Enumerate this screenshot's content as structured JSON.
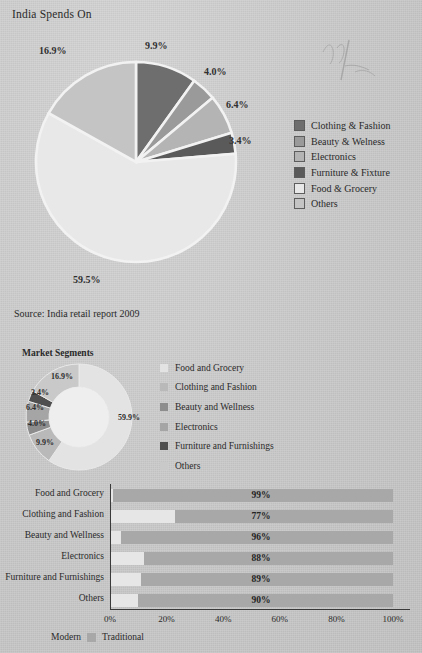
{
  "page": {
    "background_color": "#cdcdcd",
    "title": "India Spends On",
    "source": "Source: India retail report 2009",
    "scribble_icon": "handwriting-scribble"
  },
  "pie_chart": {
    "title": "India Spends On",
    "legend_title": "",
    "legend": [
      {
        "label": "Clothing & Fashion",
        "color": "#6e6e6e"
      },
      {
        "label": "Beauty & Welness",
        "color": "#9a9a9a"
      },
      {
        "label": "Electronics",
        "color": "#b4b4b4"
      },
      {
        "label": "Furniture & Fixture",
        "color": "#5a5a5a"
      },
      {
        "label": "Food & Grocery",
        "color": "#e8e8e8"
      },
      {
        "label": "Others",
        "color": "#c4c4c4"
      }
    ],
    "labels": [
      "9.9%",
      "4.0%",
      "6.4%",
      "3.4%",
      "59.5%",
      "16.9%"
    ]
  },
  "donut_chart": {
    "title": "Market Segments",
    "legend": [
      {
        "label": "Food and Grocery",
        "color": "#e3e3e3"
      },
      {
        "label": "Clothing and Fashion",
        "color": "#b9b9b9"
      },
      {
        "label": "Beauty and Wellness",
        "color": "#8d8d8d"
      },
      {
        "label": "Electronics",
        "color": "#a5a5a5"
      },
      {
        "label": "Furniture and Furnishings",
        "color": "#4f4f4f"
      },
      {
        "label": "Others",
        "color": "#c9c9c9"
      }
    ],
    "labels": [
      "59.9%",
      "9.9%",
      "4.0%",
      "6.4%",
      "3.4%",
      "16.9%"
    ]
  },
  "bar_chart": {
    "legend": [
      {
        "label": "Modern",
        "color": "#e6e6e6"
      },
      {
        "label": "Traditional",
        "color": "#a8a8a8"
      }
    ],
    "ticks": [
      "0%",
      "20%",
      "40%",
      "60%",
      "80%",
      "100%"
    ],
    "rows": [
      {
        "category": "Food and Grocery",
        "modern": 1,
        "traditional": 99,
        "value_label": "99%"
      },
      {
        "category": "Clothing and Fashion",
        "modern": 23,
        "traditional": 77,
        "value_label": "77%"
      },
      {
        "category": "Beauty and Wellness",
        "modern": 4,
        "traditional": 96,
        "value_label": "96%"
      },
      {
        "category": "Electronics",
        "modern": 12,
        "traditional": 88,
        "value_label": "88%"
      },
      {
        "category": "Furniture and Furnishings",
        "modern": 11,
        "traditional": 89,
        "value_label": "89%"
      },
      {
        "category": "Others",
        "modern": 10,
        "traditional": 90,
        "value_label": "90%"
      }
    ]
  },
  "chart_data": [
    {
      "type": "pie",
      "title": "India Spends On",
      "categories": [
        "Clothing & Fashion",
        "Beauty & Welness",
        "Electronics",
        "Furniture & Fixture",
        "Food & Grocery",
        "Others"
      ],
      "values": [
        9.9,
        4.0,
        6.4,
        3.4,
        59.5,
        16.9
      ],
      "value_labels": [
        "9.9%",
        "4.0%",
        "6.4%",
        "3.4%",
        "59.5%",
        "16.9%"
      ],
      "colors": [
        "#6e6e6e",
        "#9a9a9a",
        "#b4b4b4",
        "#5a5a5a",
        "#e8e8e8",
        "#c4c4c4"
      ],
      "legend_position": "right",
      "xlabel": "",
      "ylabel": "",
      "note": "Source: India retail report 2009"
    },
    {
      "type": "pie",
      "title": "Market Segments",
      "subtitle": "donut",
      "categories": [
        "Food and Grocery",
        "Clothing and Fashion",
        "Beauty and Wellness",
        "Electronics",
        "Furniture and Furnishings",
        "Others"
      ],
      "values": [
        59.9,
        9.9,
        4.0,
        6.4,
        3.4,
        16.9
      ],
      "value_labels": [
        "59.9%",
        "9.9%",
        "4.0%",
        "6.4%",
        "3.4%",
        "16.9%"
      ],
      "colors": [
        "#e3e3e3",
        "#b9b9b9",
        "#8d8d8d",
        "#a5a5a5",
        "#4f4f4f",
        "#c9c9c9"
      ],
      "legend_position": "right"
    },
    {
      "type": "bar",
      "orientation": "horizontal",
      "stacked": true,
      "title": "",
      "categories": [
        "Food and Grocery",
        "Clothing and Fashion",
        "Beauty and Wellness",
        "Electronics",
        "Furniture and Furnishings",
        "Others"
      ],
      "series": [
        {
          "name": "Modern",
          "values": [
            1,
            23,
            4,
            12,
            11,
            10
          ],
          "color": "#e6e6e6"
        },
        {
          "name": "Traditional",
          "values": [
            99,
            77,
            96,
            88,
            89,
            90
          ],
          "color": "#a8a8a8"
        }
      ],
      "data_labels": [
        "99%",
        "77%",
        "96%",
        "88%",
        "89%",
        "90%"
      ],
      "xlabel": "",
      "ylabel": "",
      "xlim": [
        0,
        100
      ],
      "xticks": [
        "0%",
        "20%",
        "40%",
        "60%",
        "80%",
        "100%"
      ],
      "grid": false,
      "legend_position": "bottom-left"
    }
  ]
}
